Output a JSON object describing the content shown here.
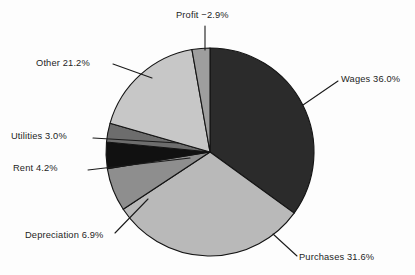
{
  "chart_data": {
    "type": "pie",
    "title": "",
    "subtitle": "",
    "xlabel": "",
    "ylabel": "",
    "legend_position": "none",
    "grid": false,
    "labels_outside": true,
    "note": "Profit is negative; positive slices sum to 102.9% of net and the negative Profit slice is drawn as 2.9% of the circle.",
    "categories": [
      "Wages",
      "Purchases",
      "Depreciation",
      "Rent",
      "Utilities",
      "Other",
      "Profit"
    ],
    "values": [
      36.0,
      31.6,
      6.9,
      4.2,
      3.0,
      21.2,
      -2.9
    ],
    "slices": [
      {
        "name": "Wages",
        "label": "Wages 36.0%",
        "value": 36.0,
        "value_text": "36.0%",
        "color": "#2b2b2b",
        "start_angle_deg": 0,
        "sweep_deg": 126.0
      },
      {
        "name": "Purchases",
        "label": "Purchases 31.6%",
        "value": 31.6,
        "value_text": "31.6%",
        "color": "#b9b9b9",
        "start_angle_deg": 126.0,
        "sweep_deg": 110.6
      },
      {
        "name": "Depreciation",
        "label": "Depreciation 6.9%",
        "value": 6.9,
        "value_text": "6.9%",
        "color": "#8e8e8e",
        "start_angle_deg": 236.6,
        "sweep_deg": 24.2
      },
      {
        "name": "Rent",
        "label": "Rent 4.2%",
        "value": 4.2,
        "value_text": "4.2%",
        "color": "#111111",
        "start_angle_deg": 260.8,
        "sweep_deg": 14.7
      },
      {
        "name": "Utilities",
        "label": "Utilities 3.0%",
        "value": 3.0,
        "value_text": "3.0%",
        "color": "#6d6d6d",
        "start_angle_deg": 275.5,
        "sweep_deg": 10.5
      },
      {
        "name": "Other",
        "label": "Other 21.2%",
        "value": 21.2,
        "value_text": "21.2%",
        "color": "#c7c7c7",
        "start_angle_deg": 286.0,
        "sweep_deg": 64.0
      },
      {
        "name": "Profit",
        "label": "Profit −2.9%",
        "value": -2.9,
        "value_text": "−2.9%",
        "color": "#9e9e9e",
        "start_angle_deg": 350.0,
        "sweep_deg": 10.0
      }
    ],
    "geometry": {
      "center_x": 210,
      "center_y": 152,
      "radius": 104
    },
    "colors": {
      "background": "#fdfdfd",
      "outline": "#141414",
      "leader_line": "#1b1b1b",
      "text": "#1e1e1e"
    }
  }
}
